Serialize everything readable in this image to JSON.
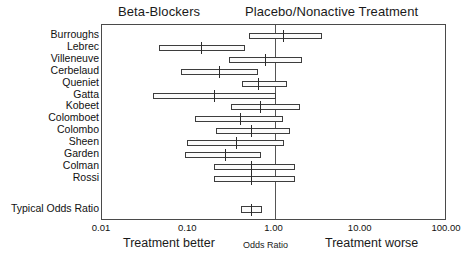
{
  "headers": {
    "left": "Beta-Blockers",
    "right": "Placebo/Nonactive Treatment"
  },
  "axis": {
    "tick_labels": [
      "0.01",
      "0.10",
      "1.00",
      "10.00",
      "100.00"
    ],
    "tick_values": [
      0.01,
      0.1,
      1,
      10,
      100
    ],
    "caption_left": "Treatment better",
    "caption_center": "Odds Ratio",
    "caption_right": "Treatment worse"
  },
  "summary_label": "Typical Odds Ratio",
  "chart_data": {
    "type": "forest",
    "title": "",
    "subtitle": "",
    "xlabel": "Odds Ratio",
    "ylabel": "",
    "xscale": "log",
    "xlim": [
      0.01,
      100.0
    ],
    "grid": false,
    "legend": "none",
    "reference_line": 1.0,
    "group_left_label": "Beta-Blockers",
    "group_right_label": "Placebo/Nonactive Treatment",
    "categories": [
      "Burroughs",
      "Lebrec",
      "Villeneuve",
      "Cerbelaud",
      "Queniet",
      "Gatta",
      "Kobeet",
      "Colomboet",
      "Colombo",
      "Sheen",
      "Garden",
      "Colman",
      "Rossi",
      "Typical Odds Ratio"
    ],
    "series": [
      {
        "name": "Odds Ratio (95% CI)",
        "points": [
          {
            "label": "Burroughs",
            "odds_ratio": 1.25,
            "ci_low": 0.5,
            "ci_high": 3.6
          },
          {
            "label": "Lebrec",
            "odds_ratio": 0.14,
            "ci_low": 0.046,
            "ci_high": 0.45
          },
          {
            "label": "Villeneuve",
            "odds_ratio": 0.78,
            "ci_low": 0.3,
            "ci_high": 2.1
          },
          {
            "label": "Cerbelaud",
            "odds_ratio": 0.23,
            "ci_low": 0.082,
            "ci_high": 0.64
          },
          {
            "label": "Queniet",
            "odds_ratio": 0.65,
            "ci_low": 0.42,
            "ci_high": 1.4
          },
          {
            "label": "Gatta",
            "odds_ratio": 0.2,
            "ci_low": 0.039,
            "ci_high": 1.05
          },
          {
            "label": "Kobeet",
            "odds_ratio": 0.68,
            "ci_low": 0.31,
            "ci_high": 2.0
          },
          {
            "label": "Colomboet",
            "odds_ratio": 0.4,
            "ci_low": 0.12,
            "ci_high": 1.25
          },
          {
            "label": "Colombo",
            "odds_ratio": 0.54,
            "ci_low": 0.21,
            "ci_high": 1.5
          },
          {
            "label": "Sheen",
            "odds_ratio": 0.36,
            "ci_low": 0.096,
            "ci_high": 1.3
          },
          {
            "label": "Garden",
            "odds_ratio": 0.27,
            "ci_low": 0.092,
            "ci_high": 0.7
          },
          {
            "label": "Colman",
            "odds_ratio": 0.54,
            "ci_low": 0.2,
            "ci_high": 1.75
          },
          {
            "label": "Rossi",
            "odds_ratio": 0.54,
            "ci_low": 0.2,
            "ci_high": 1.75
          },
          {
            "label": "Typical Odds Ratio",
            "odds_ratio": 0.54,
            "ci_low": 0.41,
            "ci_high": 0.72
          }
        ]
      }
    ]
  }
}
